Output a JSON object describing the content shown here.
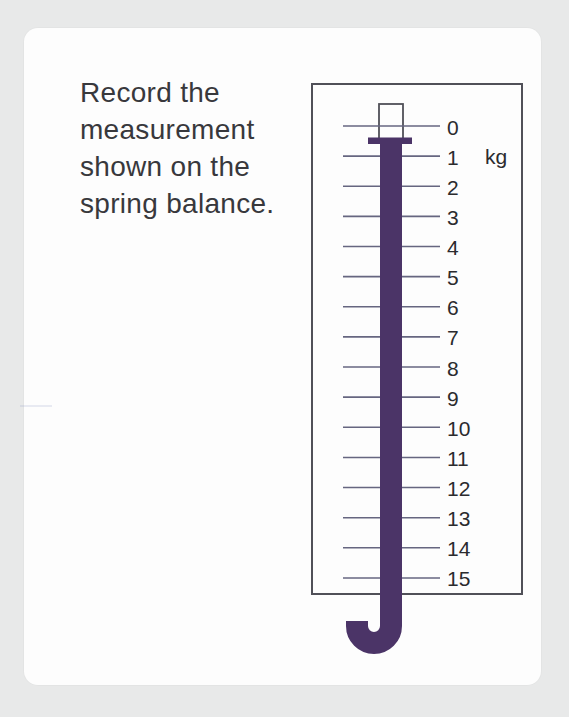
{
  "colors": {
    "page_background": "#e8e9e9",
    "card_background": "#fdfdfd",
    "bar_purple": "#4b3467",
    "tick_line": "#666680",
    "box_border": "#505058",
    "text_color": "#38383c",
    "number_color": "#2b2b2e"
  },
  "question": {
    "text": "Record the measurement shown on the spring balance.",
    "lines": [
      "Record the",
      "measurement",
      "shown on the",
      "spring balance."
    ]
  },
  "spring_balance": {
    "unit_label": "kg",
    "scale_min": 0,
    "scale_max": 15,
    "tick_interval": 1,
    "tick_labels": [
      "0",
      "1",
      "2",
      "3",
      "4",
      "5",
      "6",
      "7",
      "8",
      "9",
      "10",
      "11",
      "12",
      "13",
      "14",
      "15"
    ],
    "pointer_value_kg": 0.5
  }
}
